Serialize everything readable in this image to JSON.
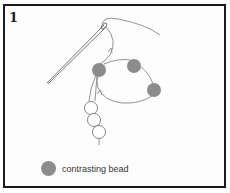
{
  "figure": {
    "step_number": "1",
    "legend": {
      "label": "contrasting bead",
      "swatch_color": "#8c8c8c"
    },
    "colors": {
      "thread": "#888888",
      "needle": "#777777",
      "contrasting_bead": "#8c8c8c",
      "plain_bead_stroke": "#777777",
      "frame": "#1a1a1a"
    },
    "beads": {
      "contrasting": [
        {
          "cx": 99,
          "cy": 70,
          "r": 7
        },
        {
          "cx": 134,
          "cy": 66,
          "r": 7
        },
        {
          "cx": 154,
          "cy": 90,
          "r": 7
        }
      ],
      "plain": [
        {
          "cx": 91,
          "cy": 108,
          "r": 6.5
        },
        {
          "cx": 94,
          "cy": 120,
          "r": 6.5
        },
        {
          "cx": 99,
          "cy": 132,
          "r": 6.5
        }
      ]
    }
  }
}
